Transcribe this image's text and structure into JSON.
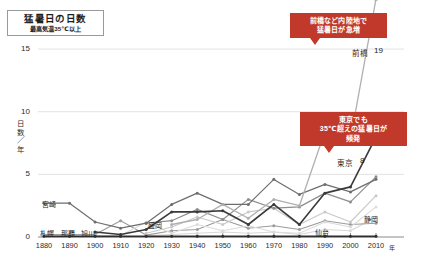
{
  "title": {
    "main": "猛暑日の日数",
    "sub": "最高気温35℃以上"
  },
  "axis": {
    "y_label_line1": "日",
    "y_label_line2": "数",
    "y_label_slash": "／",
    "y_label_line3": "年",
    "x_unit": "年",
    "yticks": [
      "0",
      "5",
      "10",
      "15"
    ],
    "xticks": [
      "1880",
      "1890",
      "1900",
      "1910",
      "1920",
      "1930",
      "1940",
      "1950",
      "1960",
      "1970",
      "1980",
      "1990",
      "2000",
      "2010"
    ]
  },
  "callouts": [
    {
      "id": "maebashi",
      "line1": "前橋など内陸地で",
      "line2": "猛暑日が急増"
    },
    {
      "id": "tokyo",
      "line1": "東京でも",
      "line2": "35℃超えの猛暑日が",
      "line3": "頻発"
    }
  ],
  "series_labels": {
    "maebashi": "前橋",
    "maebashi_value": "19",
    "tokyo": "東京",
    "tokyo_value": "8",
    "shizuoka": "静岡",
    "sendai": "仙台",
    "morioka": "盛岡",
    "miyazaki": "宮崎",
    "sapporo": "札幌",
    "naha": "那覇",
    "asahikawa": "旭川"
  },
  "colors": {
    "accent": "#c0392b",
    "maebashi": "#b0b0b0",
    "tokyo": "#3a3a3a",
    "shizuoka": "#c9c9c9",
    "sendai": "#d8d8d8",
    "morioka": "#8e8e8e",
    "miyazaki": "#6e6e6e",
    "sapporo": "#2e2e2e",
    "naha": "#9c9c9c",
    "asahikawa": "#dcdcdc",
    "grid": "#e2e2e2",
    "axis": "#8a8a8a"
  },
  "chart_data": {
    "type": "line",
    "title": "猛暑日の日数",
    "subtitle": "最高気温35℃以上",
    "xlabel": "年",
    "ylabel": "日数／年",
    "xlim": [
      1880,
      2010
    ],
    "ylim": [
      0,
      17
    ],
    "yticks": [
      0,
      5,
      10,
      15
    ],
    "grid": "horizontal",
    "legend": "inline-labels",
    "x": [
      1880,
      1890,
      1900,
      1910,
      1920,
      1930,
      1940,
      1950,
      1960,
      1970,
      1980,
      1990,
      2000,
      2010
    ],
    "series": [
      {
        "name": "前橋",
        "end_value": 19,
        "values": [
          null,
          null,
          null,
          null,
          null,
          1.0,
          1.4,
          2.6,
          1.5,
          3.0,
          2.5,
          8.4,
          7.8,
          19.0
        ]
      },
      {
        "name": "東京",
        "end_value": 8,
        "values": [
          null,
          null,
          0.4,
          0.2,
          0.6,
          2.0,
          2.0,
          2.1,
          1.0,
          2.6,
          1.0,
          3.5,
          4.0,
          8.0
        ]
      },
      {
        "name": "静岡",
        "values": [
          null,
          null,
          null,
          null,
          0.3,
          0.8,
          1.6,
          1.0,
          2.0,
          2.3,
          1.0,
          2.0,
          1.2,
          3.3
        ]
      },
      {
        "name": "仙台",
        "values": [
          null,
          null,
          null,
          null,
          0.1,
          0.2,
          0.3,
          0.4,
          0.3,
          0.4,
          0.2,
          0.6,
          0.5,
          1.6
        ]
      },
      {
        "name": "盛岡",
        "values": [
          null,
          null,
          null,
          null,
          1.1,
          1.3,
          2.2,
          1.4,
          3.0,
          2.3,
          2.4,
          3.5,
          2.8,
          4.8
        ]
      },
      {
        "name": "宮崎",
        "values": [
          2.7,
          2.7,
          1.2,
          0.7,
          1.1,
          2.6,
          3.5,
          2.6,
          2.6,
          4.6,
          3.4,
          4.2,
          3.6,
          4.6
        ]
      },
      {
        "name": "札幌",
        "values": [
          0.05,
          0.05,
          0.05,
          0.05,
          0.05,
          0.05,
          0.05,
          0.05,
          0.05,
          0.05,
          0.05,
          0.05,
          0.05,
          0.05
        ]
      },
      {
        "name": "那覇",
        "values": [
          0.2,
          0.2,
          0.2,
          1.3,
          0.15,
          0.5,
          0.6,
          1.4,
          0.7,
          0.9,
          0.6,
          1.3,
          1.0,
          1.1
        ]
      },
      {
        "name": "旭川",
        "values": [
          0.1,
          0.1,
          0.1,
          0.1,
          1.2,
          0.3,
          1.0,
          0.5,
          0.9,
          0.4,
          0.3,
          1.2,
          0.8,
          2.4
        ]
      }
    ]
  }
}
